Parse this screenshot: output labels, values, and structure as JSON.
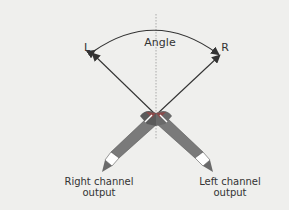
{
  "diagram": {
    "labels": {
      "angle": "Angle",
      "left": "L",
      "right": "R",
      "right_output_line1": "Right channel",
      "right_output_line2": "output",
      "left_output_line1": "Left channel",
      "left_output_line2": "output"
    },
    "colors": {
      "background": "#efefed",
      "line": "#333333",
      "mic_body": "#7a7a7a",
      "mic_dark": "#555555",
      "capsule_red": "#8a4a4a"
    }
  }
}
